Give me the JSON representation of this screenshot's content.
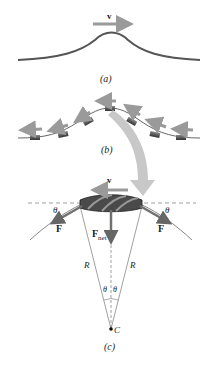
{
  "figure": {
    "panels": [
      {
        "id": "a",
        "caption": "(a)",
        "velocity_label": "v"
      },
      {
        "id": "b",
        "caption": "(b)"
      },
      {
        "id": "c",
        "caption": "(c)",
        "velocity_label": "v",
        "force_left": "F",
        "force_right": "F",
        "net_force": "F",
        "net_force_sub": "net",
        "angle_left": "θ",
        "angle_right": "θ",
        "angle_center_left": "θ",
        "angle_center_right": "θ",
        "radius_left": "R",
        "radius_right": "R",
        "center_label": "C"
      }
    ]
  },
  "colors": {
    "string": "#555555",
    "arrow": "#9a9a9a",
    "force_arrow": "#707070",
    "big_arrow": "#c8c8c8",
    "segment": "#444444",
    "lines": "#888888"
  }
}
